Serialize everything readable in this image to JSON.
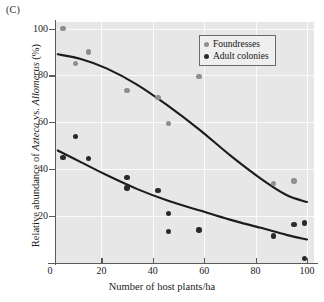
{
  "panel": {
    "label": "(C)"
  },
  "chart_data": {
    "type": "scatter",
    "title": "",
    "xlabel": "Number of host plants/ha",
    "ylabel": "Relative abundance of Azteca vs. Allomerus (%)",
    "ylabel_parts": {
      "pre": "Relative abundance of ",
      "italic1": "Azteca",
      "mid": " vs. ",
      "italic2": "Allomerus",
      "post": " (%)"
    },
    "xlim": [
      0,
      104
    ],
    "ylim": [
      0,
      104
    ],
    "xticks": [
      0,
      20,
      40,
      60,
      80,
      100
    ],
    "yticks": [
      20,
      40,
      60,
      80,
      100
    ],
    "grid": true,
    "grid_color": "#fbfbfb",
    "plot_background": "#e7e7e7",
    "legend_position": "top-right",
    "series": [
      {
        "name": "Foundresses",
        "color": "#8e8e8e",
        "marker": "circle",
        "points": [
          {
            "x": 5,
            "y": 100
          },
          {
            "x": 15,
            "y": 90
          },
          {
            "x": 10,
            "y": 85
          },
          {
            "x": 58,
            "y": 79.5
          },
          {
            "x": 30,
            "y": 73.5
          },
          {
            "x": 42,
            "y": 70.5
          },
          {
            "x": 46,
            "y": 59.5
          },
          {
            "x": 87,
            "y": 34
          },
          {
            "x": 95,
            "y": 35
          }
        ],
        "fit_curve": [
          {
            "x": 3,
            "y": 89
          },
          {
            "x": 12,
            "y": 87
          },
          {
            "x": 22,
            "y": 83
          },
          {
            "x": 34,
            "y": 76
          },
          {
            "x": 46,
            "y": 67
          },
          {
            "x": 58,
            "y": 57
          },
          {
            "x": 70,
            "y": 46
          },
          {
            "x": 82,
            "y": 36
          },
          {
            "x": 92,
            "y": 29
          },
          {
            "x": 100,
            "y": 26
          }
        ]
      },
      {
        "name": "Adult colonies",
        "color": "#2a2a2a",
        "marker": "circle",
        "points": [
          {
            "x": 10,
            "y": 54
          },
          {
            "x": 5,
            "y": 45
          },
          {
            "x": 15,
            "y": 44.5
          },
          {
            "x": 30,
            "y": 36.5
          },
          {
            "x": 30,
            "y": 32
          },
          {
            "x": 42,
            "y": 31
          },
          {
            "x": 46,
            "y": 21
          },
          {
            "x": 46,
            "y": 13.5
          },
          {
            "x": 58,
            "y": 14
          },
          {
            "x": 95,
            "y": 16.5
          },
          {
            "x": 99,
            "y": 17
          },
          {
            "x": 87,
            "y": 11.5
          },
          {
            "x": 99,
            "y": 2
          }
        ],
        "fit_curve": [
          {
            "x": 3,
            "y": 48
          },
          {
            "x": 12,
            "y": 43
          },
          {
            "x": 22,
            "y": 37.5
          },
          {
            "x": 34,
            "y": 31.5
          },
          {
            "x": 46,
            "y": 26.5
          },
          {
            "x": 58,
            "y": 22.5
          },
          {
            "x": 70,
            "y": 18.5
          },
          {
            "x": 82,
            "y": 15
          },
          {
            "x": 92,
            "y": 12
          },
          {
            "x": 100,
            "y": 10
          }
        ]
      }
    ]
  },
  "legend": {
    "items": [
      {
        "label": "Foundresses",
        "color": "#8e8e8e"
      },
      {
        "label": "Adult colonies",
        "color": "#2a2a2a"
      }
    ]
  }
}
